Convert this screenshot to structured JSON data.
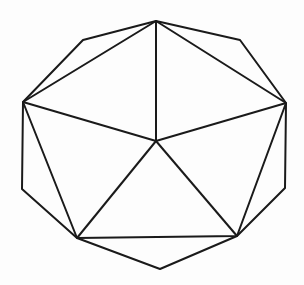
{
  "diagram": {
    "title": "",
    "stroke_color": "#1a1a1a",
    "background": "#fdfdfd",
    "center": [
      156,
      141
    ],
    "outer_vertices": [
      [
        156,
        21
      ],
      [
        240,
        40
      ],
      [
        286,
        103
      ],
      [
        285,
        188
      ],
      [
        237,
        236
      ],
      [
        160,
        269
      ],
      [
        77,
        238
      ],
      [
        22,
        189
      ],
      [
        23,
        102
      ],
      [
        83,
        40
      ]
    ],
    "inner_pentagon": [
      [
        156,
        21
      ],
      [
        286,
        103
      ],
      [
        237,
        236
      ],
      [
        77,
        238
      ],
      [
        23,
        102
      ]
    ],
    "spokes_to_center": [
      [
        156,
        21
      ],
      [
        286,
        103
      ],
      [
        237,
        236
      ],
      [
        77,
        238
      ],
      [
        23,
        102
      ]
    ]
  }
}
